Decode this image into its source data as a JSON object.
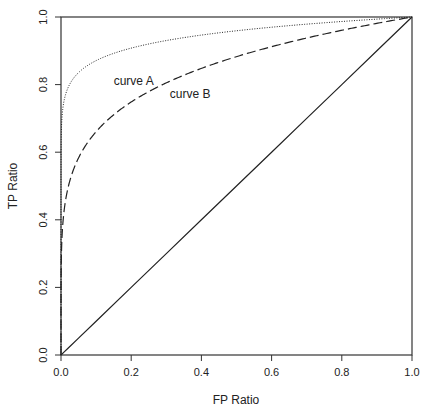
{
  "chart_data": {
    "type": "line",
    "title": "",
    "xlabel": "FP Ratio",
    "ylabel": "TP Ratio",
    "xlim": [
      0,
      1
    ],
    "ylim": [
      0,
      1
    ],
    "x_ticks": [
      "0.0",
      "0.2",
      "0.4",
      "0.6",
      "0.8",
      "1.0"
    ],
    "y_ticks": [
      "0.0",
      "0.2",
      "0.4",
      "0.6",
      "0.8",
      "1.0"
    ],
    "grid": false,
    "legend": "none (inline annotations)",
    "x": [
      0,
      0.01,
      0.02,
      0.05,
      0.1,
      0.2,
      0.3,
      0.4,
      0.5,
      0.6,
      0.7,
      0.8,
      0.9,
      1.0
    ],
    "series": [
      {
        "name": "curve A",
        "style": "dotted",
        "values": [
          0,
          0.76,
          0.79,
          0.84,
          0.87,
          0.91,
          0.93,
          0.95,
          0.96,
          0.97,
          0.98,
          0.99,
          0.99,
          1.0
        ]
      },
      {
        "name": "curve B",
        "style": "dashed",
        "values": [
          0,
          0.44,
          0.5,
          0.58,
          0.66,
          0.75,
          0.8,
          0.85,
          0.88,
          0.91,
          0.94,
          0.96,
          0.98,
          1.0
        ]
      },
      {
        "name": "chance diagonal",
        "style": "solid",
        "values": [
          0,
          0.01,
          0.02,
          0.05,
          0.1,
          0.2,
          0.3,
          0.4,
          0.5,
          0.6,
          0.7,
          0.8,
          0.9,
          1.0
        ]
      }
    ],
    "annotations": [
      {
        "text": "curve A",
        "x": 0.15,
        "y": 0.8
      },
      {
        "text": "curve B",
        "x": 0.31,
        "y": 0.76
      }
    ]
  }
}
